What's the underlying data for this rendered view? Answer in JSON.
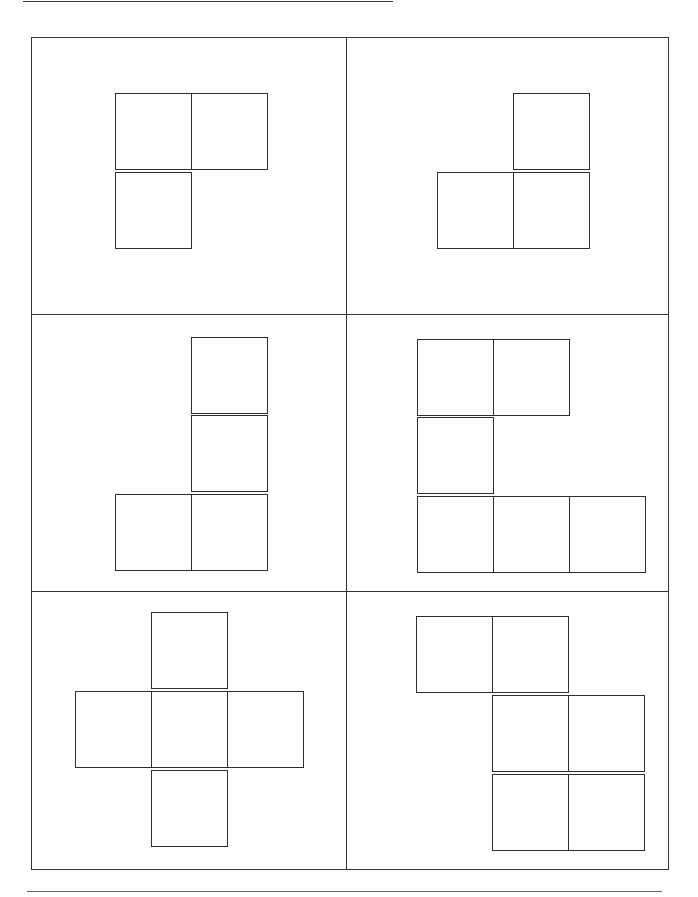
{
  "document": {
    "type": "worksheet",
    "description": "Six panels, each containing a net of unit squares",
    "colors": {
      "line": "#333333",
      "background": "#ffffff"
    },
    "top_rule": {
      "x1": 23,
      "x2": 393,
      "y": 1
    },
    "bottom_rule": {
      "x1": 27,
      "x2": 662,
      "y": 891
    },
    "frame": {
      "left": 31,
      "top": 37,
      "right": 669,
      "bottom": 870
    },
    "dividers": {
      "vertical_x": 346,
      "horizontal_y": [
        314,
        591
      ]
    },
    "cell_size": 76,
    "panels": [
      {
        "name": "panel-top-left",
        "square_count": 3,
        "squares": [
          [
            115,
            93
          ],
          [
            191,
            93
          ],
          [
            115,
            172
          ]
        ]
      },
      {
        "name": "panel-top-right",
        "square_count": 3,
        "squares": [
          [
            513,
            93
          ],
          [
            437,
            172
          ],
          [
            513,
            172
          ]
        ]
      },
      {
        "name": "panel-middle-left",
        "square_count": 4,
        "squares": [
          [
            191,
            337
          ],
          [
            191,
            415
          ],
          [
            115,
            494
          ],
          [
            191,
            494
          ]
        ]
      },
      {
        "name": "panel-middle-right",
        "square_count": 6,
        "squares": [
          [
            417,
            339
          ],
          [
            493,
            339
          ],
          [
            417,
            417
          ],
          [
            417,
            496
          ],
          [
            493,
            496
          ],
          [
            569,
            496
          ]
        ]
      },
      {
        "name": "panel-bottom-left",
        "square_count": 5,
        "squares": [
          [
            151,
            612
          ],
          [
            75,
            691
          ],
          [
            151,
            691
          ],
          [
            227,
            691
          ],
          [
            151,
            770
          ]
        ]
      },
      {
        "name": "panel-bottom-right",
        "square_count": 6,
        "squares": [
          [
            416,
            616
          ],
          [
            492,
            616
          ],
          [
            492,
            695
          ],
          [
            568,
            695
          ],
          [
            492,
            774
          ],
          [
            568,
            774
          ]
        ]
      }
    ]
  }
}
